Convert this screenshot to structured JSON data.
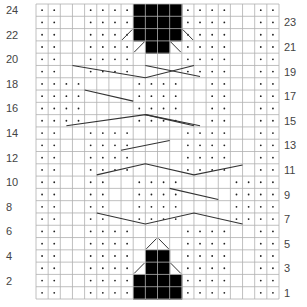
{
  "chart": {
    "title": "",
    "columns": 20,
    "rows": 24,
    "grid": {
      "left": 36,
      "top": 4,
      "right": 279,
      "bottom": 299
    },
    "colors": {
      "grid": "#b0b0b0",
      "dot": "#222222",
      "fill": "#000000",
      "line": "#333333",
      "label": "#444444"
    },
    "left_labels": [
      "24",
      "22",
      "20",
      "18",
      "16",
      "14",
      "12",
      "10",
      "8",
      "6",
      "4",
      "2"
    ],
    "right_labels": [
      "23",
      "21",
      "19",
      "17",
      "15",
      "13",
      "11",
      "9",
      "7",
      "5",
      "3",
      "1"
    ],
    "legend_symbols": {
      "dot": "purl",
      "black": "no-stitch",
      "diagonal": "decrease",
      "long-line": "cable"
    },
    "dot_rows": {
      "24": [
        1,
        2,
        5,
        6,
        7,
        8,
        13,
        14,
        15,
        16,
        19,
        20
      ],
      "23": [
        1,
        2,
        5,
        6,
        7,
        8,
        13,
        14,
        15,
        16,
        19,
        20
      ],
      "22": [
        1,
        2,
        5,
        6,
        7,
        8,
        13,
        14,
        15,
        16,
        19,
        20
      ],
      "21": [
        1,
        2,
        5,
        6,
        7,
        8,
        13,
        14,
        15,
        16,
        19,
        20
      ],
      "20": [
        1,
        2,
        5,
        6,
        7,
        8,
        13,
        14,
        15,
        16,
        19,
        20
      ],
      "19": [
        1,
        2,
        5,
        6,
        7,
        8,
        13,
        14,
        15,
        16,
        19,
        20
      ],
      "18": [
        1,
        2,
        3,
        4,
        9,
        10,
        11,
        12,
        15,
        16,
        19,
        20
      ],
      "17": [
        1,
        2,
        3,
        4,
        9,
        10,
        11,
        12,
        15,
        16,
        19,
        20
      ],
      "16": [
        1,
        2,
        3,
        4,
        9,
        10,
        11,
        12,
        15,
        16,
        19,
        20
      ],
      "15": [
        1,
        2,
        3,
        4,
        9,
        10,
        11,
        12,
        15,
        16,
        19,
        20
      ],
      "14": [
        1,
        2,
        5,
        6,
        7,
        8,
        13,
        14,
        15,
        16,
        19,
        20
      ],
      "13": [
        1,
        2,
        5,
        6,
        7,
        8,
        13,
        14,
        15,
        16,
        19,
        20
      ],
      "12": [
        1,
        2,
        5,
        6,
        7,
        8,
        13,
        14,
        15,
        16,
        19,
        20
      ],
      "11": [
        1,
        2,
        5,
        6,
        7,
        8,
        13,
        14,
        15,
        16,
        19,
        20
      ],
      "10": [
        1,
        2,
        5,
        6,
        9,
        10,
        11,
        12,
        17,
        18,
        19,
        20
      ],
      "9": [
        1,
        2,
        5,
        6,
        9,
        10,
        11,
        12,
        17,
        18,
        19,
        20
      ],
      "8": [
        1,
        2,
        5,
        6,
        9,
        10,
        11,
        12,
        17,
        18,
        19,
        20
      ],
      "7": [
        1,
        2,
        5,
        6,
        9,
        10,
        11,
        12,
        17,
        18,
        19,
        20
      ],
      "6": [
        1,
        2,
        5,
        6,
        7,
        8,
        13,
        14,
        15,
        16,
        19,
        20
      ],
      "5": [
        1,
        2,
        5,
        6,
        7,
        8,
        13,
        14,
        15,
        16,
        19,
        20
      ],
      "4": [
        1,
        2,
        5,
        6,
        7,
        8,
        13,
        14,
        15,
        16,
        19,
        20
      ],
      "3": [
        1,
        2,
        5,
        6,
        7,
        8,
        13,
        14,
        15,
        16,
        19,
        20
      ],
      "2": [
        1,
        2,
        5,
        6,
        7,
        8,
        13,
        14,
        15,
        16,
        19,
        20
      ],
      "1": [
        1,
        2,
        5,
        6,
        7,
        8,
        13,
        14,
        15,
        16,
        19,
        20
      ]
    },
    "black_cells": {
      "24": [
        9,
        10,
        11,
        12
      ],
      "23": [
        9,
        10,
        11,
        12
      ],
      "22": [
        9,
        10,
        11,
        12
      ],
      "21": [
        10,
        11
      ],
      "4": [
        10,
        11
      ],
      "3": [
        10,
        11
      ],
      "2": [
        9,
        10,
        11,
        12
      ],
      "1": [
        9,
        10,
        11,
        12
      ]
    },
    "cable_lines": [
      {
        "row": 19,
        "points": [
          [
            4,
            19.5
          ],
          [
            10,
            18.5
          ],
          [
            14,
            19.5
          ]
        ]
      },
      {
        "row": 19,
        "points": [
          [
            10,
            19.5
          ],
          [
            14.5,
            18.6
          ]
        ]
      },
      {
        "row": 17,
        "points": [
          [
            5,
            17.5
          ],
          [
            9,
            16.6
          ]
        ]
      },
      {
        "row": 15,
        "points": [
          [
            3.5,
            14.6
          ],
          [
            10,
            15.5
          ],
          [
            14,
            14.6
          ]
        ]
      },
      {
        "row": 15,
        "points": [
          [
            10,
            15.5
          ],
          [
            14.5,
            14.6
          ]
        ]
      },
      {
        "row": 13,
        "points": [
          [
            8,
            12.6
          ],
          [
            12,
            13.4
          ]
        ]
      },
      {
        "row": 11,
        "points": [
          [
            6,
            10.6
          ],
          [
            10,
            11.5
          ],
          [
            14,
            10.6
          ],
          [
            18,
            11.4
          ]
        ]
      },
      {
        "row": 9,
        "points": [
          [
            12,
            9.5
          ],
          [
            16,
            8.6
          ]
        ]
      },
      {
        "row": 7,
        "points": [
          [
            6,
            7.5
          ],
          [
            10,
            6.6
          ],
          [
            14,
            7.5
          ],
          [
            18,
            6.6
          ]
        ]
      }
    ],
    "decrease_marks": [
      {
        "row": 22,
        "col": 8,
        "dir": "left"
      },
      {
        "row": 22,
        "col": 13,
        "dir": "right"
      },
      {
        "row": 21,
        "col": 9,
        "dir": "left"
      },
      {
        "row": 21,
        "col": 12,
        "dir": "right"
      },
      {
        "row": 5,
        "col": 10,
        "dir": "left"
      },
      {
        "row": 5,
        "col": 11,
        "dir": "right"
      },
      {
        "row": 3,
        "col": 9,
        "dir": "left"
      },
      {
        "row": 3,
        "col": 12,
        "dir": "right"
      }
    ]
  }
}
